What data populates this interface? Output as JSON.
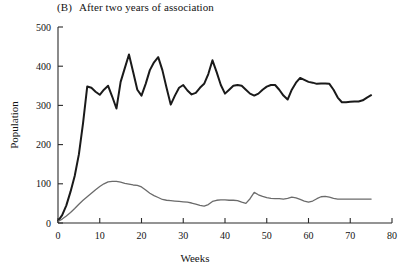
{
  "figure": {
    "panel_label": "(B)",
    "panel_title": "After two years of association"
  },
  "chart_data": {
    "type": "line",
    "xlabel": "Weeks",
    "ylabel": "Population",
    "xlim": [
      0,
      80
    ],
    "ylim": [
      0,
      500
    ],
    "xticks": [
      0,
      10,
      20,
      30,
      40,
      50,
      60,
      70,
      80
    ],
    "yticks": [
      0,
      100,
      200,
      300,
      400,
      500
    ],
    "grid": false,
    "legend": "none",
    "colors": {
      "series_1": "#1a1a1a",
      "series_2": "#6b6b6b"
    },
    "series": [
      {
        "name": "Upper population",
        "color": "#1a1a1a",
        "x": [
          0,
          1,
          2,
          3,
          4,
          5,
          6,
          7,
          8,
          9,
          10,
          11,
          12,
          13,
          14,
          15,
          16,
          17,
          18,
          19,
          20,
          21,
          22,
          23,
          24,
          25,
          26,
          27,
          28,
          29,
          30,
          31,
          32,
          33,
          34,
          35,
          36,
          37,
          38,
          39,
          40,
          41,
          42,
          43,
          44,
          45,
          46,
          47,
          48,
          49,
          50,
          51,
          52,
          53,
          54,
          55,
          56,
          57,
          58,
          59,
          60,
          61,
          62,
          63,
          64,
          65,
          66,
          67,
          68,
          69,
          70,
          71,
          72,
          73,
          74,
          75
        ],
        "values": [
          5,
          20,
          45,
          80,
          120,
          175,
          255,
          348,
          345,
          335,
          327,
          340,
          350,
          322,
          292,
          360,
          395,
          430,
          385,
          340,
          325,
          355,
          390,
          410,
          423,
          390,
          345,
          302,
          325,
          345,
          352,
          338,
          328,
          332,
          345,
          355,
          380,
          415,
          385,
          352,
          330,
          340,
          350,
          352,
          350,
          340,
          330,
          325,
          330,
          340,
          348,
          352,
          352,
          340,
          325,
          315,
          340,
          358,
          370,
          365,
          360,
          358,
          355,
          356,
          356,
          355,
          340,
          320,
          308,
          308,
          309,
          310,
          310,
          313,
          320,
          326
        ]
      },
      {
        "name": "Lower population",
        "color": "#6b6b6b",
        "x": [
          0,
          1,
          2,
          3,
          4,
          5,
          6,
          7,
          8,
          9,
          10,
          11,
          12,
          13,
          14,
          15,
          16,
          17,
          18,
          19,
          20,
          21,
          22,
          23,
          24,
          25,
          26,
          27,
          28,
          29,
          30,
          31,
          32,
          33,
          34,
          35,
          36,
          37,
          38,
          39,
          40,
          41,
          42,
          43,
          44,
          45,
          46,
          47,
          48,
          49,
          50,
          51,
          52,
          53,
          54,
          55,
          56,
          57,
          58,
          59,
          60,
          61,
          62,
          63,
          64,
          65,
          66,
          67,
          68,
          69,
          70,
          71,
          72,
          73,
          74,
          75
        ],
        "values": [
          4,
          10,
          18,
          27,
          37,
          48,
          58,
          67,
          76,
          85,
          93,
          100,
          105,
          106,
          106,
          104,
          101,
          99,
          97,
          96,
          92,
          84,
          76,
          70,
          65,
          60,
          58,
          57,
          56,
          55,
          54,
          53,
          51,
          48,
          45,
          43,
          47,
          55,
          58,
          59,
          59,
          58,
          58,
          57,
          53,
          50,
          62,
          78,
          72,
          68,
          65,
          63,
          62,
          62,
          61,
          63,
          66,
          64,
          60,
          56,
          53,
          56,
          62,
          67,
          68,
          66,
          63,
          61,
          61,
          61,
          61,
          61,
          61,
          61,
          61,
          61
        ]
      }
    ]
  }
}
